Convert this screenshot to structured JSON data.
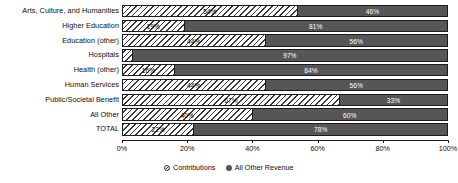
{
  "chart_data": {
    "type": "bar",
    "orientation": "horizontal",
    "stacked": true,
    "normalized_percent": true,
    "title": "",
    "subtitle": "",
    "xlabel": "",
    "ylabel": "",
    "xlim": [
      0,
      100
    ],
    "grid": false,
    "legend_position": "bottom-center",
    "categories": [
      "Arts, Culture, and Humanities",
      "Higher Education",
      "Education (other)",
      "Hospitals",
      "Health (other)",
      "Human Services",
      "Public/Societal Benefit",
      "All Other",
      "TOTAL"
    ],
    "series": [
      {
        "name": "Contributions",
        "style": "hatched",
        "color": "#ffffff",
        "values": [
          54,
          19,
          44,
          3,
          16,
          44,
          67,
          40,
          22
        ],
        "labels": [
          "54%",
          "19%",
          "44%",
          "3%",
          "16%",
          "44%",
          "67%",
          "40%",
          "22%"
        ]
      },
      {
        "name": "All Other Revenue",
        "style": "solid",
        "color": "#565656",
        "values": [
          46,
          81,
          56,
          97,
          84,
          56,
          33,
          60,
          78
        ],
        "labels": [
          "46%",
          "81%",
          "56%",
          "97%",
          "84%",
          "56%",
          "33%",
          "60%",
          "78%"
        ]
      }
    ],
    "xticks": [
      0,
      20,
      40,
      60,
      80,
      100
    ],
    "xtick_labels": [
      "0%",
      "20%",
      "40%",
      "60%",
      "80%",
      "100%"
    ],
    "legend": [
      {
        "label": "Contributions",
        "marker": "hatched-circle-icon"
      },
      {
        "label": "All Other Revenue",
        "marker": "solid-circle-icon"
      }
    ]
  },
  "colors": {
    "contributions_fill": "#ffffff",
    "contributions_hatch": "#3a3a3a",
    "other_revenue_fill": "#565656",
    "axis": "#1c1c1c",
    "text": "#0d0d0d",
    "background": "#ffffff"
  }
}
